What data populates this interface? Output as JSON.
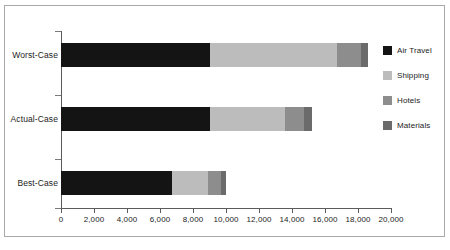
{
  "chart_data": {
    "type": "bar",
    "orientation": "horizontal",
    "stacked": true,
    "title": "",
    "subtitle": "",
    "xlabel": "",
    "ylabel": "",
    "categories": [
      "Worst-Case",
      "Actual-Case",
      "Best-Case"
    ],
    "series": [
      {
        "name": "Air Travel",
        "color": "#141414",
        "values": [
          9000,
          9000,
          6700
        ]
      },
      {
        "name": "Shipping",
        "color": "#bcbcbc",
        "values": [
          7700,
          4600,
          2200
        ]
      },
      {
        "name": "Hotels",
        "color": "#8d8d8d",
        "values": [
          1500,
          1100,
          800
        ]
      },
      {
        "name": "Materials",
        "color": "#6b6b6b",
        "values": [
          400,
          500,
          300
        ]
      }
    ],
    "totals": [
      18600,
      15200,
      10000
    ],
    "xlim": [
      0,
      20000
    ],
    "x_ticks": [
      0,
      2000,
      4000,
      6000,
      8000,
      10000,
      12000,
      14000,
      16000,
      18000,
      20000
    ],
    "x_tick_labels": [
      "0",
      "2,000",
      "4,000",
      "6,000",
      "8,000",
      "10,000",
      "12,000",
      "14,000",
      "16,000",
      "18,000",
      "20,000"
    ],
    "grid": false,
    "legend_position": "right",
    "legend_entries": [
      "Air Travel",
      "Shipping",
      "Hotels",
      "Materials"
    ]
  },
  "colors": {
    "frame": "#a9a9a9",
    "axis": "#5b5b5b",
    "tick": "#7a7a7a",
    "text": "#1c1c1c",
    "background": "#ffffff"
  }
}
